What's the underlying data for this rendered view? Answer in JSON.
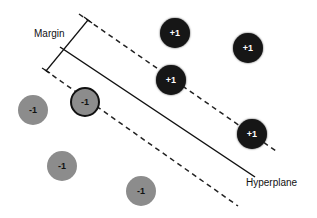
{
  "labels": {
    "margin": "Margin",
    "hyperplane": "Hyperplane"
  },
  "points": [
    {
      "class": "+1",
      "label": "+1",
      "x": 175,
      "y": 33,
      "support_vector": false
    },
    {
      "class": "+1",
      "label": "+1",
      "x": 248,
      "y": 48,
      "support_vector": false
    },
    {
      "class": "+1",
      "label": "+1",
      "x": 171,
      "y": 80,
      "support_vector": true
    },
    {
      "class": "+1",
      "label": "+1",
      "x": 252,
      "y": 134,
      "support_vector": true
    },
    {
      "class": "-1",
      "label": "-1",
      "x": 33,
      "y": 110,
      "support_vector": false
    },
    {
      "class": "-1",
      "label": "-1",
      "x": 85,
      "y": 102,
      "support_vector": true
    },
    {
      "class": "-1",
      "label": "-1",
      "x": 62,
      "y": 166,
      "support_vector": false
    },
    {
      "class": "-1",
      "label": "-1",
      "x": 141,
      "y": 191,
      "support_vector": false
    }
  ],
  "colors": {
    "positive": "#161616",
    "negative": "#8c8c8c"
  }
}
